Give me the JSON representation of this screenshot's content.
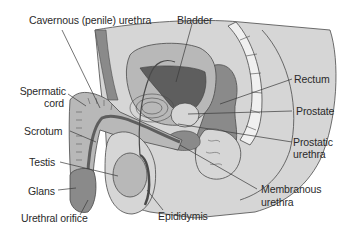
{
  "diagram": {
    "labels": {
      "cavernous_urethra": "Cavernous (penile) urethra",
      "bladder": "Bladder",
      "rectum": "Rectum",
      "spermatic_cord_line1": "Spermatic",
      "spermatic_cord_line2": "cord",
      "prostate": "Prostate",
      "scrotum": "Scrotum",
      "prostatic_urethra_line1": "Prostatic",
      "prostatic_urethra_line2": "urethra",
      "testis": "Testis",
      "glans": "Glans",
      "membranous_urethra_line1": "Membranous",
      "membranous_urethra_line2": "urethra",
      "urethral_orifice": "Urethral orifice",
      "epididymis": "Epididymis"
    },
    "colors": {
      "body_fill": "#d6d6d6",
      "tissue_mid": "#b8b8b8",
      "tissue_dark": "#8a8a8a",
      "bladder_lumen": "#5e5e5e",
      "outline": "#4a4a4a",
      "leader_line": "#3a3a3a",
      "vertebrae": "#f0f0f0"
    }
  }
}
